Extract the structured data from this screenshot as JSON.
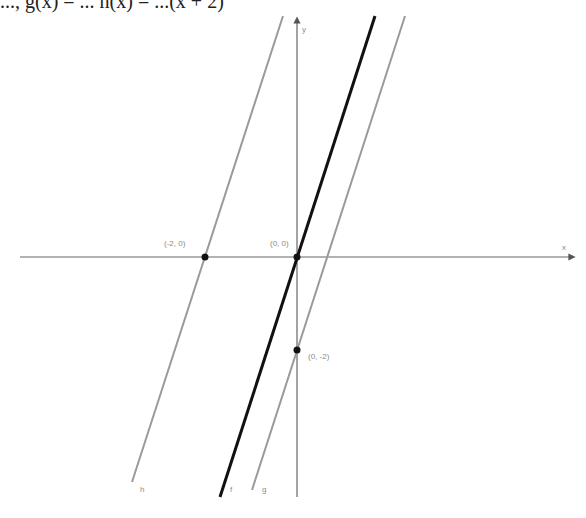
{
  "header": {
    "equation_fragment": "..., g(x) = ... h(x) = ...(x + 2)"
  },
  "graph": {
    "axes": {
      "x_label": "x",
      "y_label": "y",
      "origin_px": [
        297,
        257
      ],
      "unit_px": 46
    },
    "lines": [
      {
        "name": "f",
        "label": "f",
        "equation": "y = 3x",
        "color": "#111111",
        "width": 3
      },
      {
        "name": "g",
        "label": "g",
        "equation": "y = 3x - 2",
        "color": "#9a9a9a",
        "width": 2
      },
      {
        "name": "h",
        "label": "h",
        "equation": "y = 3(x + 2)",
        "color": "#9a9a9a",
        "width": 2
      }
    ],
    "points": [
      {
        "label": "(-2, 0)",
        "x": -2,
        "y": 0
      },
      {
        "label": "(0, 0)",
        "x": 0,
        "y": 0
      },
      {
        "label": "(0, -2)",
        "x": 0,
        "y": -2
      }
    ]
  }
}
